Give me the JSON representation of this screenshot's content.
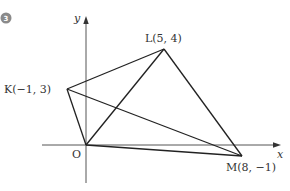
{
  "problem": {
    "number": "3",
    "badge_color": "#8a8a8a"
  },
  "axes": {
    "x_label": "x",
    "y_label": "y",
    "origin_label": "O",
    "axis_color": "#555555"
  },
  "points": {
    "K": {
      "label": "K(−1, 3)",
      "x": -1,
      "y": 3
    },
    "L": {
      "label": "L(5, 4)",
      "x": 5,
      "y": 4
    },
    "M": {
      "label": "M(8, −1)",
      "x": 8,
      "y": -1
    },
    "O": {
      "label": "O",
      "x": 0,
      "y": 0
    }
  },
  "segments": [
    [
      "O",
      "K"
    ],
    [
      "K",
      "L"
    ],
    [
      "L",
      "M"
    ],
    [
      "M",
      "O"
    ],
    [
      "O",
      "L"
    ],
    [
      "K",
      "M"
    ]
  ],
  "line_color": "#222222"
}
